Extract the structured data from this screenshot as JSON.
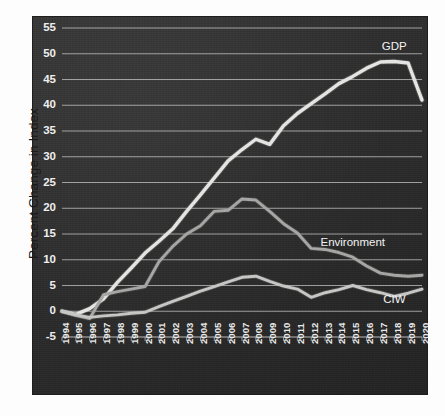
{
  "chart_data": {
    "type": "line",
    "title": "",
    "xlabel": "",
    "ylabel": "Percent Change in Index",
    "ylim": [
      -5,
      55
    ],
    "yticks": [
      -5,
      0,
      5,
      10,
      15,
      20,
      25,
      30,
      35,
      40,
      45,
      50,
      55
    ],
    "grid": true,
    "legend_position": "inline-right-end-labels",
    "categories": [
      1994,
      1995,
      1996,
      1997,
      1998,
      1999,
      2000,
      2001,
      2002,
      2003,
      2004,
      2005,
      2006,
      2007,
      2008,
      2009,
      2010,
      2011,
      2012,
      2013,
      2014,
      2015,
      2016,
      2017,
      2018,
      2019,
      2020
    ],
    "x": [
      "1994",
      "1995",
      "1996",
      "1997",
      "1998",
      "1999",
      "2000",
      "2001",
      "2002",
      "2003",
      "2004",
      "2005",
      "2006",
      "2007",
      "2008",
      "2009",
      "2010",
      "2011",
      "2012",
      "2013",
      "2014",
      "2015",
      "2016",
      "2017",
      "2018",
      "2019",
      "2020"
    ],
    "series": [
      {
        "name": "GDP",
        "color": "#e8e8e6",
        "values": [
          0,
          -0.6,
          0.5,
          2.4,
          5.6,
          8.4,
          11.3,
          13.6,
          16.0,
          19.4,
          22.6,
          25.9,
          29.2,
          31.4,
          33.4,
          32.4,
          36.0,
          38.4,
          40.3,
          42.2,
          44.2,
          45.6,
          47.2,
          48.4,
          48.5,
          48.2,
          41.0
        ]
      },
      {
        "name": "Environment",
        "color": "#a8a8a6",
        "values": [
          0,
          -0.8,
          -1.4,
          3.2,
          3.8,
          4.3,
          4.8,
          9.6,
          12.6,
          15.0,
          16.6,
          19.4,
          19.6,
          21.8,
          21.6,
          19.4,
          17.0,
          15.2,
          12.2,
          12.0,
          11.4,
          10.5,
          8.8,
          7.4,
          7.0,
          6.8,
          7.0
        ]
      },
      {
        "name": "CIW",
        "color": "#c9c9c7",
        "values": [
          0,
          -0.7,
          -1.2,
          -0.9,
          -0.7,
          -0.4,
          -0.2,
          0.9,
          1.9,
          2.9,
          3.9,
          4.8,
          5.7,
          6.6,
          6.8,
          5.8,
          4.9,
          4.3,
          2.7,
          3.6,
          4.2,
          5.0,
          4.2,
          3.6,
          2.9,
          3.5,
          4.3
        ]
      }
    ],
    "annotations": [
      {
        "text": "GDP",
        "series": "GDP",
        "anchor_year": 2018,
        "anchor_value": 50.8
      },
      {
        "text": "Environment",
        "series": "Environment",
        "anchor_year": 2015,
        "anchor_value": 12.6
      },
      {
        "text": "CIW",
        "series": "CIW",
        "anchor_year": 2018,
        "anchor_value": 1.6
      }
    ]
  },
  "figure": {
    "background_color": "#fdfdfd",
    "panel_color": "#2e2e2e",
    "grid_color": "#cfcfcf",
    "text_color": "#f2f2f2",
    "axis_title_color": "#1a1a1a"
  }
}
